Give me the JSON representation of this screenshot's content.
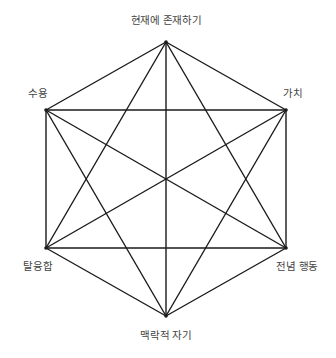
{
  "diagram": {
    "type": "hexaflex",
    "line_color": "#1a1a1a",
    "text_color": "#444444",
    "nodes": [
      {
        "id": "top",
        "label": "현재에 존재하기",
        "x": 166,
        "y": 42,
        "lx": 166,
        "ly": 19
      },
      {
        "id": "upper-right",
        "label": "가치",
        "x": 286,
        "y": 110,
        "lx": 293,
        "ly": 92
      },
      {
        "id": "lower-right",
        "label": "전념 행동",
        "x": 286,
        "y": 248,
        "lx": 297,
        "ly": 265
      },
      {
        "id": "bottom",
        "label": "맥락적 자기",
        "x": 166,
        "y": 316,
        "lx": 166,
        "ly": 334
      },
      {
        "id": "lower-left",
        "label": "탈융합",
        "x": 46,
        "y": 248,
        "lx": 38,
        "ly": 265
      },
      {
        "id": "upper-left",
        "label": "수용",
        "x": 46,
        "y": 110,
        "lx": 38,
        "ly": 92
      }
    ],
    "edges": "complete"
  },
  "labels": {
    "top": "현재에 존재하기",
    "upper_right": "가치",
    "lower_right": "전념 행동",
    "bottom": "맥락적 자기",
    "lower_left": "탈융합",
    "upper_left": "수용"
  }
}
